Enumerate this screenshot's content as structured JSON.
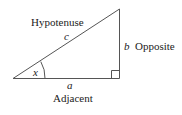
{
  "diagram": {
    "type": "right-triangle",
    "labels": {
      "hypotenuse": "Hypotenuse",
      "opposite": "Opposite",
      "adjacent": "Adjacent"
    },
    "variables": {
      "angle": "x",
      "hypotenuse_side": "c",
      "opposite_side": "b",
      "adjacent_side": "a"
    },
    "colors": {
      "stroke": "#555555",
      "text": "#222222",
      "background": "#ffffff"
    }
  }
}
